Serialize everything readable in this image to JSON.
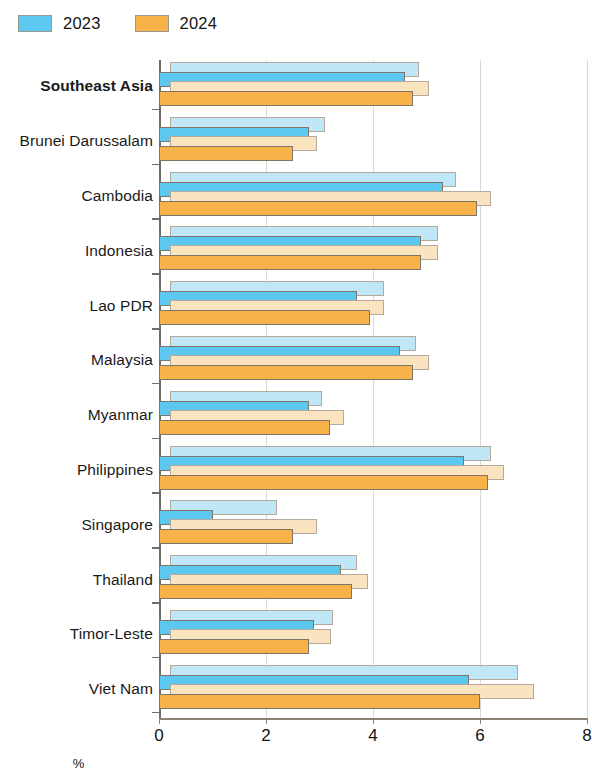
{
  "legend": {
    "items": [
      {
        "label": "2023",
        "color": "#5cc8ef",
        "swatch_name": "legend-swatch-2023"
      },
      {
        "label": "2024",
        "color": "#f7b24a",
        "swatch_name": "legend-swatch-2024"
      }
    ]
  },
  "axis": {
    "x_title": "%",
    "x_ticks": [
      "0",
      "2",
      "4",
      "6",
      "8"
    ]
  },
  "chart_data": {
    "type": "bar",
    "orientation": "horizontal",
    "title": "",
    "subtitle": "",
    "xlabel": "%",
    "ylabel": "",
    "xlim": [
      0,
      8
    ],
    "xticks": [
      0,
      2,
      4,
      6,
      8
    ],
    "grid": "vertical gridlines at x ticks",
    "legend_position": "top-left",
    "categories": [
      "Southeast Asia",
      "Brunei Darussalam",
      "Cambodia",
      "Indonesia",
      "Lao PDR",
      "Malaysia",
      "Myanmar",
      "Philippines",
      "Singapore",
      "Thailand",
      "Timor-Leste",
      "Viet Nam"
    ],
    "highlight_category": "Southeast Asia",
    "series": [
      {
        "name": "2023",
        "color": "#5cc8ef",
        "shadow_color": "#bfe7f7",
        "values": [
          4.6,
          2.8,
          5.3,
          4.9,
          3.7,
          4.5,
          2.8,
          5.7,
          1.0,
          3.4,
          2.9,
          5.8
        ],
        "shadow_values": [
          4.65,
          2.9,
          5.35,
          5.0,
          4.0,
          4.6,
          2.85,
          6.0,
          2.0,
          3.5,
          3.05,
          6.5
        ]
      },
      {
        "name": "2024",
        "color": "#f7b24a",
        "shadow_color": "#fae3bf",
        "values": [
          4.75,
          2.5,
          5.95,
          4.9,
          3.95,
          4.75,
          3.2,
          6.15,
          2.5,
          3.6,
          2.8,
          6.0
        ],
        "shadow_values": [
          4.85,
          2.75,
          6.0,
          5.0,
          4.0,
          4.85,
          3.25,
          6.25,
          2.75,
          3.7,
          3.0,
          6.8
        ]
      }
    ]
  }
}
